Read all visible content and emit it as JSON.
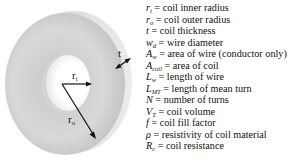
{
  "figure": {
    "labels": {
      "inner_radius": "r",
      "inner_radius_sub": "i",
      "outer_radius": "r",
      "outer_radius_sub": "o",
      "thickness": "t"
    },
    "colors": {
      "ring_light": "#dcdcdc",
      "ring_mid": "#c6c6c6",
      "ring_side": "#e4e4e4",
      "hole": "#ffffff",
      "arrow": "#111111"
    }
  },
  "legend": [
    {
      "sym": "r",
      "sub": "i",
      "eq": " = ",
      "desc": "coil inner radius"
    },
    {
      "sym": "r",
      "sub": "o",
      "eq": " = ",
      "desc": "coil outer radius"
    },
    {
      "sym": "t",
      "sub": "",
      "eq": " = ",
      "desc": "coil thickness"
    },
    {
      "sym": "w",
      "sub": "d",
      "eq": " = ",
      "desc": "wire diameter"
    },
    {
      "sym": "A",
      "sub": "w",
      "eq": " = ",
      "desc": "area of wire (conductor only)"
    },
    {
      "sym": "A",
      "sub": "coil",
      "eq": " = ",
      "desc": "area of coil"
    },
    {
      "sym": "L",
      "sub": "w",
      "eq": " = ",
      "desc": "length of wire"
    },
    {
      "sym": "L",
      "sub": "MT",
      "eq": " = ",
      "desc": "length of mean turn"
    },
    {
      "sym": "N",
      "sub": "",
      "eq": " = ",
      "desc": "number of turns"
    },
    {
      "sym": "V",
      "sub": "T",
      "eq": " = ",
      "desc": "coil volume"
    },
    {
      "sym": "f",
      "sub": "",
      "eq": " = ",
      "desc": "coil fill factor"
    },
    {
      "sym": "ρ",
      "sub": "",
      "eq": " = ",
      "desc": "resistivity of coil material"
    },
    {
      "sym": "R",
      "sub": "c",
      "eq": " = ",
      "desc": "coil resistance"
    }
  ]
}
